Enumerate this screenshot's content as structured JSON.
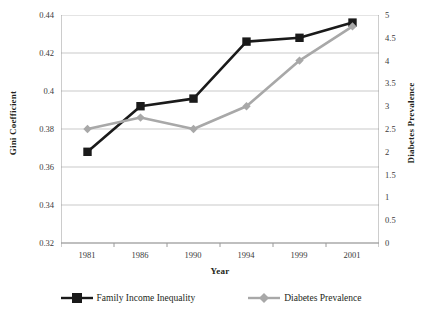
{
  "chart_data": {
    "type": "line",
    "title": "",
    "xlabel": "Year",
    "ylabel": "Gini Coefficient",
    "y2label": "Diabetes Prevalence",
    "categories": [
      "1981",
      "1986",
      "1990",
      "1994",
      "1999",
      "2001"
    ],
    "grid": true,
    "legend_position": "bottom",
    "ylim": [
      0.32,
      0.44
    ],
    "y_ticks": [
      "0.44",
      "0.42",
      "0.4",
      "0.38",
      "0.36",
      "0.34",
      "0.32"
    ],
    "y_tick_values": [
      0.44,
      0.42,
      0.4,
      0.38,
      0.36,
      0.34,
      0.32
    ],
    "y2lim": [
      0,
      5
    ],
    "y2_ticks": [
      "5",
      "4.5",
      "4",
      "3.5",
      "3",
      "2.5",
      "2",
      "1.5",
      "1",
      "0.5",
      "0"
    ],
    "y2_tick_values": [
      5,
      4.5,
      4,
      3.5,
      3,
      2.5,
      2,
      1.5,
      1,
      0.5,
      0
    ],
    "series": [
      {
        "name": "Family Income Inequality",
        "axis": "left",
        "color": "#1a1a1a",
        "marker": "square",
        "values": [
          0.368,
          0.392,
          0.396,
          0.426,
          0.428,
          0.436
        ]
      },
      {
        "name": "Diabetes Prevalence",
        "axis": "right",
        "color": "#a8a8a8",
        "marker": "diamond",
        "values": [
          2.5,
          2.75,
          2.5,
          3.0,
          4.0,
          4.75
        ]
      }
    ]
  },
  "legend": {
    "items": [
      {
        "label": "Family Income Inequality",
        "marker": "square-marker-icon",
        "color": "#1a1a1a"
      },
      {
        "label": "Diabetes Prevalence",
        "marker": "diamond-marker-icon",
        "color": "#a8a8a8"
      }
    ]
  },
  "style": {
    "gridline_color": "#c9c9c9",
    "axis_color": "#9a9a9a",
    "background": "#ffffff"
  }
}
